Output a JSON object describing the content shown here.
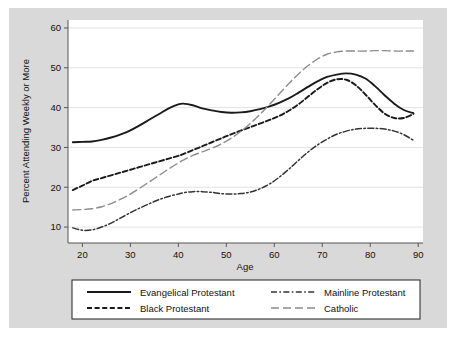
{
  "chart_data": {
    "type": "line",
    "title": "",
    "xlabel": "Age",
    "ylabel": "Percent Attending Weekly or More",
    "xlim": [
      17,
      91
    ],
    "ylim": [
      6,
      62
    ],
    "xticks": [
      20,
      30,
      40,
      50,
      60,
      70,
      80,
      90
    ],
    "yticks": [
      10,
      20,
      30,
      40,
      50,
      60
    ],
    "grid": "horizontal",
    "legend_position": "below-plot",
    "background_color": "#d9d9d9",
    "plot_background_color": "#ffffff",
    "x": [
      18,
      20,
      22,
      24,
      26,
      28,
      30,
      32,
      34,
      36,
      38,
      40,
      41,
      43,
      45,
      47,
      49,
      51,
      53,
      55,
      57,
      59,
      61,
      63,
      65,
      67,
      69,
      71,
      73,
      75,
      77,
      79,
      81,
      83,
      85,
      87,
      89
    ],
    "series": [
      {
        "name": "Evangelical Protestant",
        "line_style": "solid",
        "color": "#1a1a1a",
        "values": [
          31.3,
          31.4,
          31.5,
          31.9,
          32.5,
          33.3,
          34.3,
          35.6,
          37.0,
          38.4,
          39.8,
          40.8,
          41.0,
          40.6,
          39.8,
          39.3,
          38.9,
          38.7,
          38.8,
          39.1,
          39.6,
          40.3,
          41.2,
          42.3,
          43.7,
          45.2,
          46.6,
          47.7,
          48.3,
          48.6,
          48.3,
          47.3,
          45.4,
          43.1,
          41.0,
          39.4,
          38.6
        ]
      },
      {
        "name": "Black Protestant",
        "line_style": "dashed",
        "color": "#1a1a1a",
        "values": [
          19.3,
          20.4,
          21.6,
          22.3,
          23.0,
          23.7,
          24.4,
          25.1,
          25.8,
          26.5,
          27.2,
          27.9,
          28.3,
          29.3,
          30.3,
          31.3,
          32.3,
          33.3,
          34.2,
          35.1,
          36.0,
          36.9,
          37.9,
          39.2,
          40.8,
          42.7,
          44.6,
          46.2,
          47.1,
          47.0,
          45.6,
          43.3,
          40.7,
          38.5,
          37.4,
          37.4,
          38.4
        ]
      },
      {
        "name": "Mainline Protestant",
        "line_style": "dashdot",
        "color": "#333333",
        "values": [
          9.8,
          9.2,
          9.3,
          10.0,
          11.0,
          12.3,
          13.6,
          14.8,
          15.9,
          16.9,
          17.7,
          18.3,
          18.6,
          18.9,
          18.9,
          18.7,
          18.4,
          18.3,
          18.4,
          18.8,
          19.6,
          20.8,
          22.5,
          24.5,
          26.7,
          28.8,
          30.6,
          32.1,
          33.3,
          34.1,
          34.6,
          34.8,
          34.8,
          34.6,
          34.1,
          33.2,
          31.8
        ]
      },
      {
        "name": "Catholic",
        "line_style": "longdash",
        "color": "#8c8c8c",
        "values": [
          14.3,
          14.4,
          14.6,
          15.1,
          15.9,
          17.0,
          18.3,
          19.8,
          21.4,
          23.0,
          24.6,
          26.1,
          26.8,
          28.0,
          28.9,
          29.8,
          30.9,
          32.3,
          34.0,
          36.0,
          38.3,
          40.8,
          43.4,
          46.0,
          48.4,
          50.5,
          52.2,
          53.4,
          54.0,
          54.2,
          54.2,
          54.2,
          54.3,
          54.3,
          54.2,
          54.2,
          54.2
        ]
      }
    ]
  },
  "axes": {
    "y_title": "Percent Attending Weekly or More",
    "x_title": "Age",
    "y_tick_labels": [
      "10",
      "20",
      "30",
      "40",
      "50",
      "60"
    ],
    "x_tick_labels": [
      "20",
      "30",
      "40",
      "50",
      "60",
      "70",
      "80",
      "90"
    ]
  },
  "legend": {
    "entries": [
      {
        "label": "Evangelical Protestant"
      },
      {
        "label": "Mainline Protestant"
      },
      {
        "label": "Black Protestant"
      },
      {
        "label": "Catholic"
      }
    ]
  }
}
